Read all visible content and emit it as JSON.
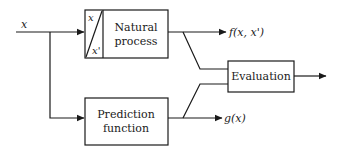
{
  "diagram": {
    "input_label": "x",
    "natural_process": {
      "line1": "Natural",
      "line2": "process",
      "sub_top": "x",
      "sub_bottom": "x'"
    },
    "prediction_function": {
      "line1": "Prediction",
      "line2": "function"
    },
    "evaluation": {
      "label": "Evaluation"
    },
    "outputs": {
      "natural": "f(x, x')",
      "prediction": "g(x)"
    },
    "colors": {
      "stroke": "#1a1a1a",
      "background": "#ffffff"
    }
  }
}
